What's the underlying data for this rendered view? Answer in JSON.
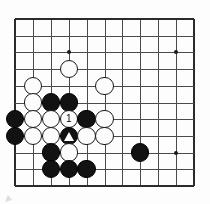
{
  "figure": {
    "kind": "go-board-diagram",
    "board": {
      "columns": 11,
      "rows": 11,
      "grid_left": 15,
      "grid_top": 19,
      "col_spacing": 17.9,
      "row_spacing": 16.7,
      "line_color": "#4a4a4a",
      "edge_color": "#2b2b2b",
      "background_color": "#fdfdfd",
      "stone_radius": 9.2
    },
    "star_points": [
      {
        "col": 4,
        "row": 3
      },
      {
        "col": 10,
        "row": 3
      },
      {
        "col": 10,
        "row": 9
      }
    ],
    "stones": [
      {
        "col": 4,
        "row": 4,
        "color": "white",
        "label": "",
        "mark": ""
      },
      {
        "col": 2,
        "row": 5,
        "color": "white",
        "label": "",
        "mark": ""
      },
      {
        "col": 6,
        "row": 5,
        "color": "white",
        "label": "",
        "mark": ""
      },
      {
        "col": 2,
        "row": 6,
        "color": "white",
        "label": "",
        "mark": ""
      },
      {
        "col": 3,
        "row": 6,
        "color": "black",
        "label": "",
        "mark": ""
      },
      {
        "col": 4,
        "row": 6,
        "color": "black",
        "label": "",
        "mark": ""
      },
      {
        "col": 1,
        "row": 7,
        "color": "black",
        "label": "",
        "mark": ""
      },
      {
        "col": 2,
        "row": 7,
        "color": "white",
        "label": "",
        "mark": ""
      },
      {
        "col": 3,
        "row": 7,
        "color": "white",
        "label": "",
        "mark": ""
      },
      {
        "col": 4,
        "row": 7,
        "color": "white",
        "label": "1",
        "mark": ""
      },
      {
        "col": 5,
        "row": 7,
        "color": "black",
        "label": "",
        "mark": ""
      },
      {
        "col": 6,
        "row": 7,
        "color": "white",
        "label": "",
        "mark": ""
      },
      {
        "col": 1,
        "row": 8,
        "color": "black",
        "label": "",
        "mark": ""
      },
      {
        "col": 2,
        "row": 8,
        "color": "white",
        "label": "",
        "mark": ""
      },
      {
        "col": 3,
        "row": 8,
        "color": "white",
        "label": "",
        "mark": ""
      },
      {
        "col": 4,
        "row": 8,
        "color": "black",
        "label": "",
        "mark": "triangle"
      },
      {
        "col": 5,
        "row": 8,
        "color": "white",
        "label": "",
        "mark": ""
      },
      {
        "col": 6,
        "row": 8,
        "color": "white",
        "label": "",
        "mark": ""
      },
      {
        "col": 3,
        "row": 9,
        "color": "black",
        "label": "",
        "mark": ""
      },
      {
        "col": 4,
        "row": 9,
        "color": "white",
        "label": "",
        "mark": ""
      },
      {
        "col": 8,
        "row": 9,
        "color": "black",
        "label": "",
        "mark": ""
      },
      {
        "col": 3,
        "row": 10,
        "color": "black",
        "label": "",
        "mark": ""
      },
      {
        "col": 4,
        "row": 10,
        "color": "black",
        "label": "",
        "mark": ""
      },
      {
        "col": 5,
        "row": 10,
        "color": "black",
        "label": "",
        "mark": ""
      }
    ],
    "move_labels": [
      "1"
    ],
    "markers": [
      "triangle"
    ]
  }
}
